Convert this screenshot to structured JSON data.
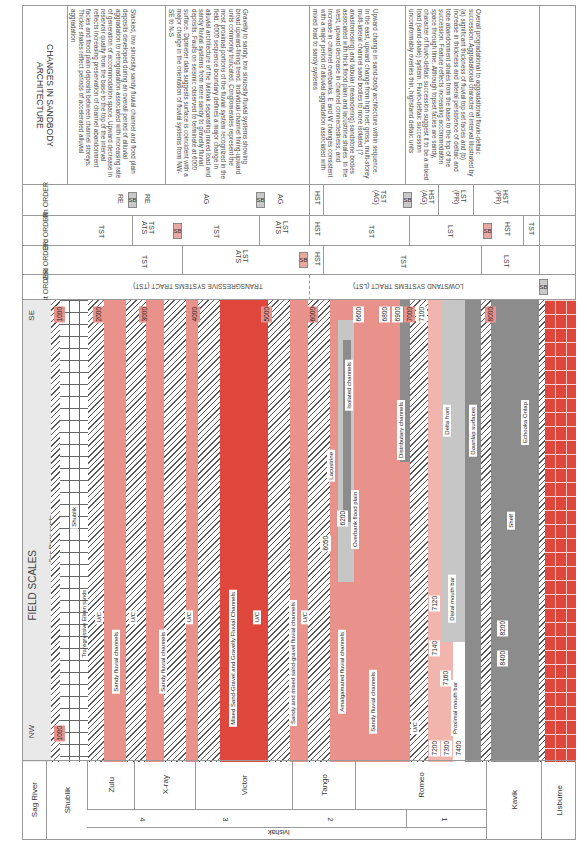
{
  "orientation": "rotated 90 degrees clockwise",
  "header": {
    "changes_title": "CHANGES IN SANDBODY ARCHITECTURE",
    "order_4": "4th ORDER",
    "order_3": "3rd ORDER",
    "order_2": "2nd ORDER",
    "order_1": "1st ORDER",
    "field_scales": "FIELD SCALES",
    "nw": "NW",
    "se": "SE"
  },
  "changes": [
    {
      "text": "Stacked, low sinuosity sandy fluvial channel and flood plain deposits developed during an overall period of alluvial aggradation to retrogradation associated with increasing rate of generation of accommodation space. Upward decrease in reservoir quality from the base to the top of the interval reflects increasing preservation of channel abandonment facies and flood plain deposits between channel storeys. Thicker shales reflect periods of accelerated alluvial aggradation"
    },
    {
      "text": "Gravelly to sandy, low sinuosity fluvial systems showing broad upward-fining trend. Individual channel fining-upward units commonly truncated. Conglomerates represent the most proximal portions of the fluvial system recognized in the field. 6000 sequence boundary defines a major change in alluvial architecture of the Ivishak separating mixed load and sandy fluvial systems from more sandy to gravelly fluvial deposits. Faults on seismic observed to terminate at 6000 surface. Dipmeter data suggests surface is coincident with a major change in the orientation of fluvial systems from NW-SE to N-S"
    },
    {
      "text": "Upward change in sand-body architecture within sequence. In the east, upward change from high net: gross, multi-storey multi-lateral channel sand bodies to more isolated (? anastomosing) and tabular (meandering) sandstone bodies associated with thick flood plain and lacustrine shales. In the west, upward decrease in channel connectedness, and increase in channel overbanks. E and W changes consistent with a major period of alluvial aggradation associated with mixed load to sandy systems"
    },
    {
      "text": "Overall progradational to aggradational fluvio-deltaic succession. Aggradational character of interval illustrated by (a) significant thickness of fluvial top set facies and (b) increase in thickness and lateral persistence of deltaic and lobe abandonment shales from the base to the top of the succession. Feature reflects increasing accommodation space through time. Although topset facies are sandy, character of fluvio-deltaic succession suggest it to be a mixed load (sand-shale) system. Fluvio-deltaic succession uncomformably overlies thin, highstand deltaic units"
    },
    {
      "text": ""
    }
  ],
  "order4": [
    "RE",
    "SB",
    "RE",
    "AG",
    "SB",
    "AG",
    "HST",
    "TST (AG)",
    "SB",
    "HST (AG)",
    "LST (PR)",
    "HST (PR)"
  ],
  "order3": [
    "TST",
    "TST ATS",
    "SB",
    "TST",
    "LST ATS",
    "HST",
    "TST",
    "LST",
    "SB",
    "HST",
    "TST"
  ],
  "order2": [
    "TST",
    "LST ATS",
    "SB",
    "HST",
    "TST",
    "LST"
  ],
  "order1": [
    "TRANSGRESSIVE SYSTEMS TRACT (TST)",
    "LOWSTAND SYSTEMS TRACT (LST)",
    "SB"
  ],
  "field": {
    "depths": [
      "1000",
      "2000",
      "3000",
      "4000",
      "5000",
      "6000",
      "6050",
      "6200",
      "6600",
      "6800",
      "6900",
      "7000",
      "7100",
      "7120",
      "7140",
      "7160",
      "7200",
      "7300",
      "7400",
      "8000",
      "8200",
      "8400"
    ],
    "labels": {
      "sag_river_sands": "Sag River sands",
      "shublik": "Shublik",
      "eileen": "Transgressive Eileen sands",
      "uc": "U/C",
      "sandy_fluvial": "Sandy fluvial channels",
      "mixed_sand_gravel": "Mixed Sand-Gravel and Gravelly Fluvial Channels",
      "sandy_mixed": "Sandy and mixed sand-gravel fluvial channels",
      "amalgamated": "Amalgamated fluvial channels",
      "isolated": "Isolated channels",
      "lacustrine": "Lacustrine",
      "overbank": "Overbank flood plain",
      "distributary": "Distributary channels",
      "delta_front": "Delta front",
      "distal_bar": "Distal mouth bar",
      "proximal_bar": "Proximal mouth bar",
      "downlap": "Downlap surfaces",
      "shelf": "Shelf",
      "echooka": "Echooka Onlap"
    }
  },
  "formations": {
    "sag_river": "Sag River",
    "shublik": "Shublik",
    "zulu": "Zulu",
    "xray": "X-ray",
    "victor": "Victor",
    "tango": "Tango",
    "romeo": "Romeo",
    "kavik": "Kavik",
    "lisburne": "Lisburne",
    "units": [
      "4",
      "3",
      "2",
      "1"
    ],
    "ivishak": "Ivishak"
  },
  "colors": {
    "sand_pink": "#e9928b",
    "gravel_red": "#e0473c",
    "shale_grey": "#8c8c8c",
    "sb_grey": "#c9c9c9",
    "sb_red": "#e9a9a3"
  }
}
